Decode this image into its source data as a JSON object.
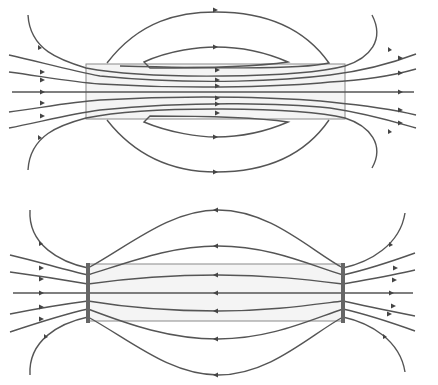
{
  "diagram": {
    "type": "field-lines",
    "panels": [
      {
        "id": "top",
        "description": "Field lines through a uniformly filled rectangular body (lines pass through the body, loops return outside)",
        "rect": {
          "x": 86,
          "y": 64,
          "w": 259,
          "h": 55
        },
        "colors": {
          "line": "#555555",
          "rect_fill": "#ededed",
          "rect_stroke": "#8a8a8a"
        }
      },
      {
        "id": "bottom",
        "description": "Field lines with end plates: lines converge at the two end plates of a rectangular body",
        "rect": {
          "x": 88,
          "y": 264,
          "w": 255,
          "h": 57
        },
        "plates": [
          {
            "x": 88
          },
          {
            "x": 343
          }
        ],
        "colors": {
          "line": "#555555",
          "rect_fill": "#ededed",
          "rect_stroke": "#8a8a8a",
          "plate": "#666666"
        }
      }
    ]
  }
}
